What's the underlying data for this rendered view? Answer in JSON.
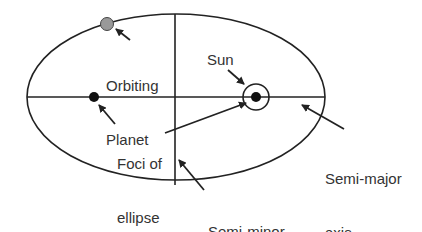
{
  "diagram": {
    "colors": {
      "line": "#222222",
      "planet": "#999999",
      "text": "#333333",
      "background": "#ffffff"
    },
    "labels": {
      "orbiting_planet": [
        "Orbiting",
        "Planet"
      ],
      "sun": "Sun",
      "foci": [
        "Foci of",
        "ellipse"
      ],
      "semi_major": [
        "Semi-major",
        "axis"
      ],
      "semi_minor": [
        "Semi-minor",
        "axis"
      ]
    }
  }
}
